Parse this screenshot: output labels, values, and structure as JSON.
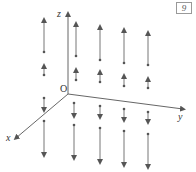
{
  "figure": {
    "type": "3d-vector-field",
    "tag_label": "9",
    "axes": {
      "x_label": "x",
      "y_label": "y",
      "z_label": "z",
      "origin_label": "O"
    },
    "colors": {
      "axis": "#555555",
      "arrow": "#666666",
      "dot": "#555555"
    },
    "columns_x_px": [
      44,
      76,
      100,
      124,
      148
    ],
    "arrows": [
      {
        "col": 0,
        "x": 44,
        "y_base": 52,
        "y_tip": 20,
        "dir": "up"
      },
      {
        "col": 0,
        "x": 44,
        "y_base": 75,
        "y_tip": 66,
        "dir": "up"
      },
      {
        "col": 0,
        "x": 44,
        "y_base": 98,
        "y_tip": 110,
        "dir": "down"
      },
      {
        "col": 0,
        "x": 44,
        "y_base": 121,
        "y_tip": 155,
        "dir": "down"
      },
      {
        "col": 1,
        "x": 76,
        "y_base": 56,
        "y_tip": 24,
        "dir": "up"
      },
      {
        "col": 1,
        "x": 76,
        "y_base": 80,
        "y_tip": 70,
        "dir": "up"
      },
      {
        "col": 1,
        "x": 74,
        "y_base": 103,
        "y_tip": 116,
        "dir": "down"
      },
      {
        "col": 1,
        "x": 74,
        "y_base": 125,
        "y_tip": 158,
        "dir": "down"
      },
      {
        "col": 2,
        "x": 100,
        "y_base": 60,
        "y_tip": 27,
        "dir": "up"
      },
      {
        "col": 2,
        "x": 100,
        "y_base": 82,
        "y_tip": 72,
        "dir": "up"
      },
      {
        "col": 2,
        "x": 100,
        "y_base": 106,
        "y_tip": 117,
        "dir": "down"
      },
      {
        "col": 2,
        "x": 100,
        "y_base": 128,
        "y_tip": 162,
        "dir": "down"
      },
      {
        "col": 3,
        "x": 124,
        "y_base": 63,
        "y_tip": 30,
        "dir": "up"
      },
      {
        "col": 3,
        "x": 124,
        "y_base": 86,
        "y_tip": 76,
        "dir": "up"
      },
      {
        "col": 3,
        "x": 124,
        "y_base": 109,
        "y_tip": 120,
        "dir": "down"
      },
      {
        "col": 3,
        "x": 124,
        "y_base": 131,
        "y_tip": 165,
        "dir": "down"
      },
      {
        "col": 4,
        "x": 148,
        "y_base": 65,
        "y_tip": 33,
        "dir": "up"
      },
      {
        "col": 4,
        "x": 148,
        "y_base": 88,
        "y_tip": 79,
        "dir": "up"
      },
      {
        "col": 4,
        "x": 148,
        "y_base": 112,
        "y_tip": 122,
        "dir": "down"
      },
      {
        "col": 4,
        "x": 148,
        "y_base": 134,
        "y_tip": 167,
        "dir": "down"
      }
    ]
  }
}
